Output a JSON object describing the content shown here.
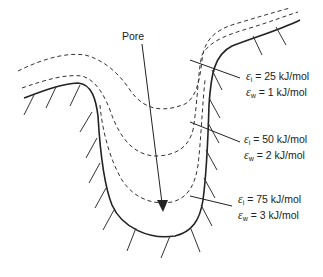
{
  "diagram": {
    "pore_label": "Pore",
    "annotations": [
      {
        "eps_i_symbol": "ε",
        "eps_i_sub": "i",
        "eps_i_value": "= 25 kJ/mol",
        "eps_w_symbol": "ε",
        "eps_w_sub": "w",
        "eps_w_value": "=  1 kJ/mol"
      },
      {
        "eps_i_symbol": "ε",
        "eps_i_sub": "i",
        "eps_i_value": "= 50 kJ/mol",
        "eps_w_symbol": "ε",
        "eps_w_sub": "w",
        "eps_w_value": "= 2 kJ/mol"
      },
      {
        "eps_i_symbol": "ε",
        "eps_i_sub": "i",
        "eps_i_value": "= 75 kJ/mol",
        "eps_w_symbol": "ε",
        "eps_w_sub": "w",
        "eps_w_value": "= 3 kJ/mol"
      }
    ],
    "colors": {
      "line": "#222222",
      "background": "#ffffff"
    }
  }
}
